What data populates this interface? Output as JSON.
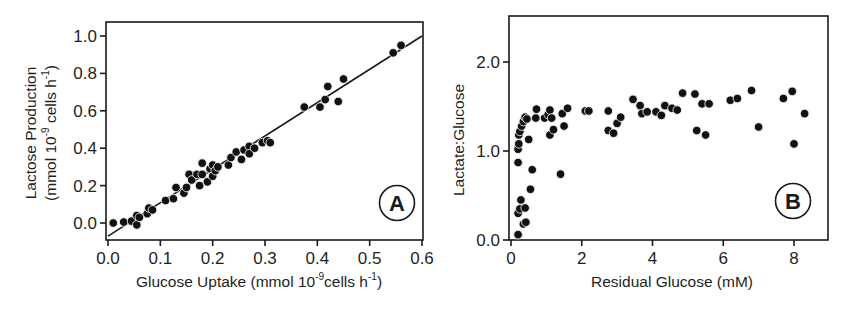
{
  "chart_data": [
    {
      "id": "A",
      "type": "scatter",
      "panel_label": "A",
      "title": "",
      "xlabel": "Glucose Uptake (mmol  10^-9 cells  h^-1)",
      "xlabel_parts": {
        "pre": "Glucose Uptake (mmol  10",
        "sup1": "-9",
        "mid": "cells  h",
        "sup2": "-1",
        "post": ")"
      },
      "ylabel": "Lactose Production (mmol  10^-9 cells  h^-1)",
      "ylabel_line1": "Lactose Production",
      "ylabel_line2_parts": {
        "pre": "(mmol  10",
        "sup1": "-9",
        "mid": " cells  h",
        "sup2": "-1",
        "post": ")"
      },
      "xlim": [
        0.0,
        0.6
      ],
      "ylim": [
        -0.1,
        1.08
      ],
      "xticks": [
        0.0,
        0.1,
        0.2,
        0.3,
        0.4,
        0.5,
        0.6
      ],
      "xtick_labels": [
        "0.0",
        "0.1",
        "0.2",
        "0.3",
        "0.4",
        "0.5",
        "0.6"
      ],
      "yticks": [
        0.0,
        0.2,
        0.4,
        0.6,
        0.8,
        1.0
      ],
      "ytick_labels": [
        "0.0",
        "0.2",
        "0.4",
        "0.6",
        "0.8",
        "1.0"
      ],
      "grid": false,
      "legend": null,
      "fit_line": {
        "x": [
          0.0,
          0.6
        ],
        "y": [
          -0.07,
          1.0
        ]
      },
      "points": [
        [
          0.01,
          0.0
        ],
        [
          0.03,
          0.005
        ],
        [
          0.045,
          0.01
        ],
        [
          0.055,
          0.04
        ],
        [
          0.055,
          -0.01
        ],
        [
          0.06,
          0.03
        ],
        [
          0.075,
          0.05
        ],
        [
          0.078,
          0.08
        ],
        [
          0.085,
          0.07
        ],
        [
          0.11,
          0.12
        ],
        [
          0.125,
          0.13
        ],
        [
          0.13,
          0.19
        ],
        [
          0.145,
          0.16
        ],
        [
          0.15,
          0.19
        ],
        [
          0.155,
          0.26
        ],
        [
          0.16,
          0.23
        ],
        [
          0.17,
          0.26
        ],
        [
          0.175,
          0.2
        ],
        [
          0.18,
          0.32
        ],
        [
          0.18,
          0.26
        ],
        [
          0.19,
          0.22
        ],
        [
          0.195,
          0.29
        ],
        [
          0.2,
          0.31
        ],
        [
          0.2,
          0.25
        ],
        [
          0.205,
          0.28
        ],
        [
          0.21,
          0.3
        ],
        [
          0.23,
          0.31
        ],
        [
          0.235,
          0.35
        ],
        [
          0.245,
          0.38
        ],
        [
          0.255,
          0.34
        ],
        [
          0.26,
          0.39
        ],
        [
          0.27,
          0.41
        ],
        [
          0.27,
          0.37
        ],
        [
          0.28,
          0.4
        ],
        [
          0.295,
          0.43
        ],
        [
          0.305,
          0.44
        ],
        [
          0.31,
          0.43
        ],
        [
          0.375,
          0.62
        ],
        [
          0.405,
          0.62
        ],
        [
          0.415,
          0.66
        ],
        [
          0.42,
          0.73
        ],
        [
          0.44,
          0.65
        ],
        [
          0.45,
          0.77
        ],
        [
          0.545,
          0.91
        ],
        [
          0.56,
          0.95
        ]
      ]
    },
    {
      "id": "B",
      "type": "scatter",
      "panel_label": "B",
      "title": "",
      "xlabel": "Residual Glucose (mM)",
      "ylabel": "Lactate:Glucose",
      "xlim": [
        0,
        9.0
      ],
      "ylim": [
        0.0,
        2.5
      ],
      "xticks": [
        0,
        2,
        4,
        6,
        8
      ],
      "xtick_labels": [
        "0",
        "2",
        "4",
        "6",
        "8"
      ],
      "yticks": [
        0.0,
        1.0,
        2.0
      ],
      "ytick_labels": [
        "0.0",
        "1.0",
        "2.0"
      ],
      "grid": false,
      "legend": null,
      "points": [
        [
          0.2,
          0.06
        ],
        [
          0.2,
          0.87
        ],
        [
          0.2,
          1.02
        ],
        [
          0.22,
          1.08
        ],
        [
          0.22,
          1.18
        ],
        [
          0.25,
          1.22
        ],
        [
          0.2,
          0.3
        ],
        [
          0.25,
          0.35
        ],
        [
          0.28,
          0.45
        ],
        [
          0.35,
          0.18
        ],
        [
          0.42,
          0.2
        ],
        [
          0.4,
          0.36
        ],
        [
          0.3,
          1.28
        ],
        [
          0.35,
          1.33
        ],
        [
          0.4,
          1.38
        ],
        [
          0.45,
          1.36
        ],
        [
          0.5,
          1.13
        ],
        [
          0.55,
          0.57
        ],
        [
          0.6,
          0.79
        ],
        [
          0.7,
          1.37
        ],
        [
          0.72,
          1.47
        ],
        [
          0.95,
          1.37
        ],
        [
          1.05,
          1.41
        ],
        [
          1.1,
          1.46
        ],
        [
          1.1,
          1.18
        ],
        [
          1.15,
          1.37
        ],
        [
          1.2,
          1.24
        ],
        [
          1.4,
          0.74
        ],
        [
          1.45,
          1.42
        ],
        [
          1.5,
          1.28
        ],
        [
          1.6,
          1.48
        ],
        [
          2.1,
          1.45
        ],
        [
          2.2,
          1.45
        ],
        [
          2.75,
          1.45
        ],
        [
          2.75,
          1.23
        ],
        [
          2.9,
          1.2
        ],
        [
          3.0,
          1.31
        ],
        [
          3.1,
          1.38
        ],
        [
          3.45,
          1.58
        ],
        [
          3.65,
          1.51
        ],
        [
          3.7,
          1.42
        ],
        [
          3.85,
          1.44
        ],
        [
          4.1,
          1.44
        ],
        [
          4.25,
          1.4
        ],
        [
          4.35,
          1.51
        ],
        [
          4.55,
          1.48
        ],
        [
          4.7,
          1.46
        ],
        [
          4.85,
          1.65
        ],
        [
          5.2,
          1.64
        ],
        [
          5.25,
          1.23
        ],
        [
          5.4,
          1.53
        ],
        [
          5.5,
          1.18
        ],
        [
          5.6,
          1.53
        ],
        [
          6.2,
          1.57
        ],
        [
          6.4,
          1.59
        ],
        [
          6.8,
          1.68
        ],
        [
          7.0,
          1.27
        ],
        [
          7.7,
          1.59
        ],
        [
          7.95,
          1.67
        ],
        [
          8.0,
          1.08
        ],
        [
          8.3,
          1.42
        ]
      ]
    }
  ]
}
